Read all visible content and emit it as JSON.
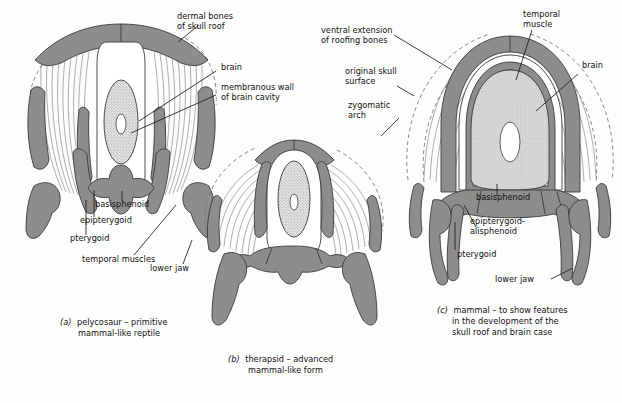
{
  "figure": {
    "background_color": "#fdfdfd",
    "bone_color": "#8d8d8d",
    "brain_stipple_color": "#c9c9c9",
    "outline_color": "#3a3a3a",
    "muscle_fiber_color": "#6d6d6d"
  },
  "panels": [
    {
      "id": "a",
      "caption_marker": "(a)",
      "caption_line1": "pelycosaur – primitive",
      "caption_line2": "mammal-like reptile",
      "labels": {
        "dermal_bones_l1": "dermal bones",
        "dermal_bones_l2": "of skull roof",
        "brain": "brain",
        "membranous_l1": "membranous wall",
        "membranous_l2": "of brain cavity",
        "basisphenoid": "basisphenoid",
        "epipterygoid": "epipterygoid",
        "pterygoid": "pterygoid",
        "temporal_muscles": "temporal muscles",
        "lower_jaw": "lower jaw"
      }
    },
    {
      "id": "b",
      "caption_marker": "(b)",
      "caption_line1": "therapsid – advanced",
      "caption_line2": "mammal-like form",
      "labels": {
        "zygomatic_l1": "zygomatic",
        "zygomatic_l2": "arch"
      }
    },
    {
      "id": "c",
      "caption_marker": "(c)",
      "caption_line1": "mammal – to show features",
      "caption_line2": "in the development of the",
      "caption_line3": "skull roof and brain case",
      "labels": {
        "ventral_ext_l1": "ventral extension",
        "ventral_ext_l2": "of roofing bones",
        "original_skull_l1": "original skull",
        "original_skull_l2": "surface",
        "temporal_muscle_l1": "temporal",
        "temporal_muscle_l2": "muscle",
        "brain": "brain",
        "basisphenoid": "basisphenoid",
        "epipterygoid_l1": "epipterygoid-",
        "epipterygoid_l2": "alisphenoid",
        "pterygoid": "pterygoid",
        "lower_jaw": "lower jaw"
      }
    }
  ]
}
